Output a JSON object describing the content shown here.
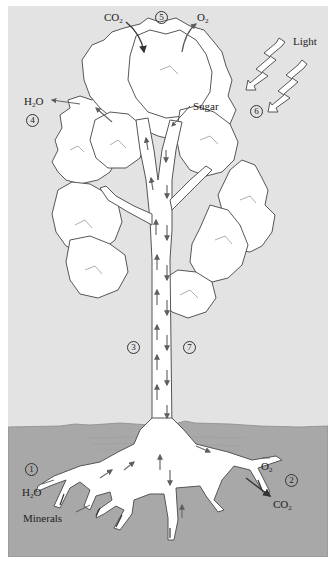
{
  "diagram": {
    "type": "plant transport illustration",
    "colors": {
      "sky": "#e3e3e3",
      "soil": "#a8a8a8",
      "plant_fill": "#ffffff",
      "outline": "#555555",
      "arrow": "#6b6b6b",
      "border": "#ffffff"
    },
    "labels": {
      "co2_top": {
        "main": "CO",
        "sub": "2"
      },
      "o2_top": {
        "main": "O",
        "sub": "2"
      },
      "light": "Light",
      "h2o_leaf": {
        "pre": "H",
        "sub": "2",
        "post": "O"
      },
      "sugar": "Sugar",
      "o2_root": {
        "main": "O",
        "sub": "2"
      },
      "co2_root": {
        "main": "CO",
        "sub": "2"
      },
      "h2o_root": {
        "pre": "H",
        "sub": "2",
        "post": "O"
      },
      "minerals": "Minerals"
    },
    "step_markers": [
      {
        "id": "1",
        "label": "1"
      },
      {
        "id": "2",
        "label": "2"
      },
      {
        "id": "3",
        "label": "3"
      },
      {
        "id": "4",
        "label": "4"
      },
      {
        "id": "5",
        "label": "5"
      },
      {
        "id": "6",
        "label": "6"
      },
      {
        "id": "7",
        "label": "7"
      }
    ]
  }
}
